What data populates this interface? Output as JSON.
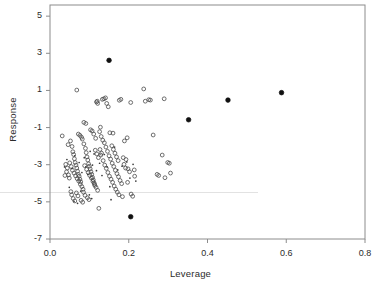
{
  "chart_data": {
    "type": "scatter",
    "title": "",
    "xlabel": "Leverage",
    "ylabel": "Response",
    "xlim": [
      0.0,
      0.8
    ],
    "ylim": [
      -7,
      5.6
    ],
    "grid": false,
    "legend": null,
    "xticks": [
      0.0,
      0.2,
      0.4,
      0.6,
      0.8
    ],
    "xtick_labels": [
      "0.0",
      "0.2",
      "0.4",
      "0.6",
      "0.8"
    ],
    "yticks": [
      5,
      3,
      1,
      -1,
      -3,
      -5,
      -7
    ],
    "ytick_labels": [
      "5",
      "3",
      "1",
      "-1",
      "-3",
      "-5",
      "-7"
    ],
    "series": [
      {
        "name": "observations",
        "marker": "open-circle",
        "color": "#4a4a4a",
        "points": [
          [
            0.031,
            -1.45
          ],
          [
            0.068,
            1.02
          ],
          [
            0.086,
            -0.72
          ],
          [
            0.091,
            -0.78
          ],
          [
            0.118,
            0.38
          ],
          [
            0.12,
            0.42
          ],
          [
            0.121,
            0.3
          ],
          [
            0.133,
            0.52
          ],
          [
            0.137,
            0.55
          ],
          [
            0.141,
            0.6
          ],
          [
            0.144,
            0.3
          ],
          [
            0.148,
            0.12
          ],
          [
            0.128,
            -0.98
          ],
          [
            0.152,
            -1.28
          ],
          [
            0.16,
            -1.3
          ],
          [
            0.176,
            0.47
          ],
          [
            0.18,
            0.52
          ],
          [
            0.186,
            -2.62
          ],
          [
            0.196,
            -1.55
          ],
          [
            0.205,
            0.35
          ],
          [
            0.214,
            -3.28
          ],
          [
            0.238,
            1.08
          ],
          [
            0.242,
            0.42
          ],
          [
            0.251,
            0.5
          ],
          [
            0.255,
            0.48
          ],
          [
            0.262,
            -1.4
          ],
          [
            0.272,
            -3.52
          ],
          [
            0.276,
            -3.58
          ],
          [
            0.285,
            -2.48
          ],
          [
            0.29,
            0.55
          ],
          [
            0.292,
            -3.7
          ],
          [
            0.299,
            -2.88
          ],
          [
            0.303,
            -2.92
          ],
          [
            0.306,
            -3.45
          ],
          [
            0.046,
            -1.92
          ],
          [
            0.052,
            -1.72
          ],
          [
            0.056,
            -2.02
          ],
          [
            0.058,
            -2.3
          ],
          [
            0.06,
            -2.45
          ],
          [
            0.062,
            -2.68
          ],
          [
            0.064,
            -2.88
          ],
          [
            0.066,
            -3.02
          ],
          [
            0.068,
            -3.18
          ],
          [
            0.07,
            -3.35
          ],
          [
            0.072,
            -3.52
          ],
          [
            0.074,
            -3.62
          ],
          [
            0.076,
            -3.78
          ],
          [
            0.078,
            -3.92
          ],
          [
            0.05,
            -2.9
          ],
          [
            0.054,
            -3.1
          ],
          [
            0.057,
            -3.3
          ],
          [
            0.061,
            -3.45
          ],
          [
            0.065,
            -3.6
          ],
          [
            0.069,
            -3.75
          ],
          [
            0.073,
            -3.88
          ],
          [
            0.077,
            -4.05
          ],
          [
            0.081,
            -4.18
          ],
          [
            0.084,
            -4.32
          ],
          [
            0.047,
            -3.55
          ],
          [
            0.049,
            -3.72
          ],
          [
            0.053,
            -4.45
          ],
          [
            0.055,
            -4.62
          ],
          [
            0.059,
            -4.82
          ],
          [
            0.063,
            -4.95
          ],
          [
            0.082,
            -1.62
          ],
          [
            0.086,
            -1.88
          ],
          [
            0.09,
            -2.12
          ],
          [
            0.092,
            -2.35
          ],
          [
            0.094,
            -2.58
          ],
          [
            0.096,
            -2.75
          ],
          [
            0.098,
            -2.95
          ],
          [
            0.1,
            -3.08
          ],
          [
            0.102,
            -3.22
          ],
          [
            0.104,
            -3.38
          ],
          [
            0.106,
            -3.52
          ],
          [
            0.108,
            -3.68
          ],
          [
            0.11,
            -3.82
          ],
          [
            0.112,
            -3.98
          ],
          [
            0.114,
            -4.12
          ],
          [
            0.088,
            -3.05
          ],
          [
            0.093,
            -3.25
          ],
          [
            0.097,
            -3.42
          ],
          [
            0.101,
            -3.58
          ],
          [
            0.105,
            -3.72
          ],
          [
            0.109,
            -3.9
          ],
          [
            0.113,
            -4.05
          ],
          [
            0.117,
            -4.22
          ],
          [
            0.121,
            -4.38
          ],
          [
            0.085,
            -4.48
          ],
          [
            0.089,
            -4.65
          ],
          [
            0.095,
            -4.78
          ],
          [
            0.099,
            -4.88
          ],
          [
            0.124,
            -5.35
          ],
          [
            0.126,
            -1.22
          ],
          [
            0.13,
            -1.48
          ],
          [
            0.134,
            -1.68
          ],
          [
            0.138,
            -1.82
          ],
          [
            0.142,
            -2.05
          ],
          [
            0.146,
            -2.28
          ],
          [
            0.15,
            -2.52
          ],
          [
            0.154,
            -2.7
          ],
          [
            0.158,
            -2.92
          ],
          [
            0.162,
            -3.1
          ],
          [
            0.166,
            -3.3
          ],
          [
            0.17,
            -3.48
          ],
          [
            0.174,
            -3.65
          ],
          [
            0.178,
            -3.85
          ],
          [
            0.182,
            -4.02
          ],
          [
            0.129,
            -2.48
          ],
          [
            0.135,
            -2.78
          ],
          [
            0.139,
            -3.02
          ],
          [
            0.143,
            -3.2
          ],
          [
            0.147,
            -3.42
          ],
          [
            0.151,
            -3.62
          ],
          [
            0.155,
            -3.78
          ],
          [
            0.159,
            -3.95
          ],
          [
            0.163,
            -4.15
          ],
          [
            0.167,
            -4.32
          ],
          [
            0.171,
            -4.48
          ],
          [
            0.175,
            -4.62
          ],
          [
            0.184,
            -4.72
          ],
          [
            0.189,
            -1.72
          ],
          [
            0.193,
            -2.72
          ],
          [
            0.198,
            -3.22
          ],
          [
            0.202,
            -3.38
          ],
          [
            0.206,
            -4.58
          ],
          [
            0.21,
            -4.7
          ],
          [
            0.215,
            -3.62
          ],
          [
            0.072,
            -1.35
          ],
          [
            0.076,
            -1.42
          ],
          [
            0.08,
            -1.52
          ],
          [
            0.103,
            -1.12
          ],
          [
            0.107,
            -1.18
          ],
          [
            0.115,
            -2.22
          ],
          [
            0.119,
            -2.42
          ],
          [
            0.123,
            -2.62
          ],
          [
            0.067,
            -4.52
          ],
          [
            0.071,
            -4.68
          ],
          [
            0.079,
            -4.92
          ],
          [
            0.083,
            -5.02
          ],
          [
            0.044,
            -3.18
          ],
          [
            0.042,
            -3.38
          ],
          [
            0.04,
            -2.98
          ],
          [
            0.038,
            -3.58
          ],
          [
            0.111,
            -1.35
          ],
          [
            0.116,
            -1.58
          ],
          [
            0.127,
            -2.18
          ],
          [
            0.131,
            -2.38
          ],
          [
            0.157,
            -1.98
          ],
          [
            0.161,
            -2.18
          ],
          [
            0.165,
            -2.38
          ],
          [
            0.169,
            -2.58
          ],
          [
            0.173,
            -2.78
          ],
          [
            0.188,
            -2.98
          ],
          [
            0.192,
            -3.18
          ],
          [
            0.197,
            -3.95
          ]
        ]
      },
      {
        "name": "small-dots",
        "marker": "dot",
        "color": "#3a3a3a",
        "points": [
          [
            0.056,
            -3.2
          ],
          [
            0.063,
            -2.52
          ],
          [
            0.074,
            -2.88
          ],
          [
            0.081,
            -3.42
          ],
          [
            0.087,
            -2.62
          ],
          [
            0.091,
            -3.12
          ],
          [
            0.096,
            -3.52
          ],
          [
            0.102,
            -2.28
          ],
          [
            0.108,
            -3.02
          ],
          [
            0.112,
            -2.42
          ],
          [
            0.118,
            -3.32
          ],
          [
            0.126,
            -2.92
          ],
          [
            0.132,
            -3.58
          ],
          [
            0.138,
            -2.45
          ],
          [
            0.145,
            -3.12
          ],
          [
            0.152,
            -4.18
          ],
          [
            0.164,
            -2.05
          ],
          [
            0.172,
            -3.28
          ],
          [
            0.183,
            -3.08
          ],
          [
            0.195,
            -2.85
          ],
          [
            0.061,
            -4.98
          ],
          [
            0.07,
            -5.08
          ],
          [
            0.078,
            -4.42
          ],
          [
            0.049,
            -4.22
          ],
          [
            0.203,
            -3.72
          ],
          [
            0.211,
            -2.98
          ],
          [
            0.218,
            -3.88
          ],
          [
            0.155,
            -4.88
          ],
          [
            0.043,
            -2.72
          ],
          [
            0.037,
            -3.12
          ],
          [
            0.1,
            -4.62
          ],
          [
            0.106,
            -4.82
          ]
        ]
      },
      {
        "name": "highlighted-points",
        "marker": "filled-circle",
        "color": "#101010",
        "points": [
          [
            0.15,
            2.62
          ],
          [
            0.588,
            0.88
          ],
          [
            0.452,
            0.48
          ],
          [
            0.352,
            -0.58
          ],
          [
            0.205,
            -5.8
          ]
        ]
      }
    ]
  }
}
